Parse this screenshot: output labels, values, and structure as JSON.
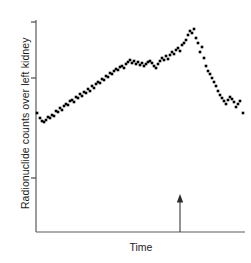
{
  "chart_data": {
    "type": "scatter",
    "title": "",
    "subtitle": "",
    "xlabel": "Time",
    "ylabel": "Radionuclide counts over left kidney",
    "grid": false,
    "legend": null,
    "axis": {
      "x_tick_labels": [],
      "y_tick_labels": [],
      "y_tick_positions": [
        22,
        78,
        178
      ],
      "x_range_px": [
        36,
        245
      ],
      "y_range_px": [
        20,
        232
      ],
      "x_axis_y_px": 232,
      "y_axis_x_px": 36
    },
    "annotations": [
      {
        "name": "injection-marker-arrow",
        "kind": "up-arrow",
        "x_px": 180,
        "y_top_px": 194,
        "y_bottom_px": 232,
        "label": ""
      }
    ],
    "marker": {
      "shape": "square",
      "size_px": 2.6,
      "color": "#000000"
    },
    "points": [
      [
        37,
        113
      ],
      [
        40,
        118
      ],
      [
        42,
        121
      ],
      [
        44,
        122
      ],
      [
        46,
        120
      ],
      [
        48,
        117
      ],
      [
        50,
        118
      ],
      [
        52,
        115
      ],
      [
        54,
        116
      ],
      [
        56,
        111
      ],
      [
        58,
        112
      ],
      [
        60,
        108
      ],
      [
        62,
        110
      ],
      [
        64,
        106
      ],
      [
        66,
        104
      ],
      [
        68,
        105
      ],
      [
        70,
        101
      ],
      [
        72,
        100
      ],
      [
        74,
        102
      ],
      [
        76,
        97
      ],
      [
        78,
        98
      ],
      [
        80,
        94
      ],
      [
        82,
        96
      ],
      [
        84,
        92
      ],
      [
        86,
        93
      ],
      [
        88,
        89
      ],
      [
        90,
        91
      ],
      [
        92,
        86
      ],
      [
        94,
        88
      ],
      [
        96,
        84
      ],
      [
        98,
        82
      ],
      [
        100,
        83
      ],
      [
        102,
        79
      ],
      [
        104,
        80
      ],
      [
        106,
        76
      ],
      [
        108,
        77
      ],
      [
        110,
        73
      ],
      [
        112,
        74
      ],
      [
        114,
        71
      ],
      [
        116,
        69
      ],
      [
        118,
        70
      ],
      [
        120,
        67
      ],
      [
        122,
        66
      ],
      [
        124,
        68
      ],
      [
        126,
        64
      ],
      [
        128,
        62
      ],
      [
        130,
        60
      ],
      [
        132,
        63
      ],
      [
        134,
        61
      ],
      [
        136,
        64
      ],
      [
        138,
        62
      ],
      [
        140,
        65
      ],
      [
        142,
        63
      ],
      [
        144,
        66
      ],
      [
        146,
        64
      ],
      [
        148,
        62
      ],
      [
        150,
        61
      ],
      [
        152,
        63
      ],
      [
        154,
        66
      ],
      [
        156,
        68
      ],
      [
        158,
        64
      ],
      [
        160,
        61
      ],
      [
        162,
        58
      ],
      [
        164,
        60
      ],
      [
        166,
        56
      ],
      [
        168,
        59
      ],
      [
        170,
        55
      ],
      [
        172,
        52
      ],
      [
        174,
        54
      ],
      [
        176,
        50
      ],
      [
        178,
        48
      ],
      [
        180,
        51
      ],
      [
        182,
        45
      ],
      [
        184,
        43
      ],
      [
        186,
        40
      ],
      [
        188,
        35
      ],
      [
        190,
        31
      ],
      [
        192,
        33
      ],
      [
        194,
        29
      ],
      [
        196,
        38
      ],
      [
        198,
        43
      ],
      [
        200,
        52
      ],
      [
        202,
        47
      ],
      [
        204,
        58
      ],
      [
        206,
        66
      ],
      [
        208,
        71
      ],
      [
        210,
        74
      ],
      [
        212,
        78
      ],
      [
        214,
        82
      ],
      [
        216,
        86
      ],
      [
        218,
        91
      ],
      [
        220,
        95
      ],
      [
        222,
        98
      ],
      [
        224,
        101
      ],
      [
        226,
        104
      ],
      [
        228,
        100
      ],
      [
        230,
        97
      ],
      [
        232,
        99
      ],
      [
        234,
        102
      ],
      [
        236,
        107
      ],
      [
        238,
        104
      ],
      [
        240,
        101
      ],
      [
        243,
        113
      ]
    ]
  },
  "figure": {
    "ylabel_text": "Radionuclide counts over left kidney",
    "xlabel_text": "Time"
  }
}
